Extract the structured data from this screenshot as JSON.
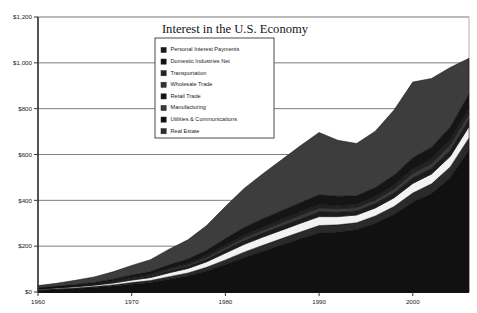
{
  "chart_data": {
    "type": "area",
    "stacked": true,
    "title": "Interest in the U.S. Economy",
    "xlabel": "",
    "ylabel": "",
    "xlim": [
      1960,
      2006
    ],
    "ylim": [
      0,
      1200
    ],
    "ytick_labels": [
      "$0",
      "$200",
      "$400",
      "$600",
      "$800",
      "$1,000",
      "$1,200"
    ],
    "ytick_values": [
      0,
      200,
      400,
      600,
      800,
      1000,
      1200
    ],
    "xtick_labels": [
      "1960",
      "1970",
      "1980",
      "1990",
      "2000"
    ],
    "xtick_values": [
      1960,
      1970,
      1980,
      1990,
      2000
    ],
    "grid": true,
    "legend_position": "top-center",
    "x": [
      1960,
      1962,
      1964,
      1966,
      1968,
      1970,
      1972,
      1974,
      1976,
      1978,
      1980,
      1982,
      1984,
      1986,
      1988,
      1990,
      1992,
      1994,
      1996,
      1998,
      2000,
      2002,
      2004,
      2006
    ],
    "series": [
      {
        "name": "Real Estate",
        "fill": "#111111",
        "values": [
          8,
          11,
          15,
          20,
          26,
          34,
          42,
          56,
          70,
          92,
          120,
          150,
          178,
          205,
          232,
          258,
          262,
          272,
          300,
          338,
          392,
          430,
          500,
          620
        ]
      },
      {
        "name": "Utilities & Communications",
        "fill": "#2a2a2a",
        "values": [
          2,
          3,
          3,
          4,
          5,
          7,
          8,
          11,
          13,
          16,
          20,
          24,
          26,
          28,
          30,
          32,
          31,
          30,
          32,
          35,
          40,
          42,
          46,
          52
        ]
      },
      {
        "name": "Manufacturing",
        "fill": "#f2f2f2",
        "values": [
          3,
          4,
          5,
          6,
          8,
          11,
          13,
          17,
          20,
          24,
          30,
          34,
          36,
          37,
          38,
          39,
          36,
          34,
          35,
          38,
          42,
          43,
          46,
          50
        ]
      },
      {
        "name": "Retail Trade",
        "fill": "#1c1c1c",
        "values": [
          1,
          2,
          2,
          3,
          4,
          5,
          6,
          8,
          9,
          11,
          14,
          16,
          17,
          18,
          19,
          20,
          19,
          18,
          19,
          21,
          24,
          25,
          27,
          30
        ]
      },
      {
        "name": "Wholesale Trade",
        "fill": "#3a3a3a",
        "values": [
          1,
          1,
          2,
          2,
          3,
          4,
          5,
          6,
          7,
          9,
          11,
          13,
          14,
          15,
          16,
          17,
          16,
          15,
          16,
          18,
          20,
          21,
          23,
          26
        ]
      },
      {
        "name": "Transportation",
        "fill": "#222222",
        "values": [
          1,
          1,
          2,
          2,
          3,
          4,
          4,
          6,
          7,
          8,
          10,
          12,
          13,
          14,
          15,
          16,
          15,
          14,
          15,
          17,
          19,
          20,
          22,
          24
        ]
      },
      {
        "name": "Domestic Industries Net",
        "fill": "#151515",
        "values": [
          2,
          3,
          4,
          5,
          7,
          9,
          11,
          15,
          18,
          22,
          28,
          33,
          36,
          38,
          40,
          42,
          39,
          37,
          39,
          43,
          49,
          51,
          56,
          62
        ]
      },
      {
        "name": "Personal Interest Payments",
        "fill": "#3d3d3d",
        "values": [
          10,
          13,
          18,
          24,
          32,
          42,
          52,
          68,
          84,
          108,
          140,
          170,
          196,
          222,
          248,
          272,
          244,
          228,
          246,
          284,
          330,
          300,
          260,
          156
        ]
      }
    ],
    "legend_entries": [
      "Personal Interest Payments",
      "Domestic Industries Net",
      "Transportation",
      "Wholesale Trade",
      "Retail Trade",
      "Manufacturing",
      "Utilities & Communications",
      "Real Estate"
    ],
    "legend_swatches": [
      "#1a1a1a",
      "#111111",
      "#242424",
      "#333333",
      "#141414",
      "#3a3a3a",
      "#101010",
      "#2e2e2e"
    ]
  }
}
